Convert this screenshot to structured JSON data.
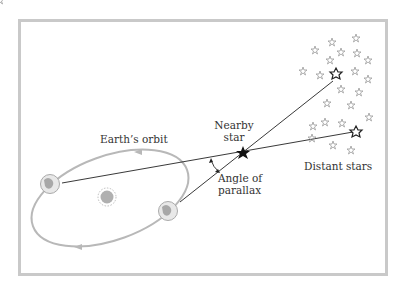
{
  "diagram": {
    "labels": {
      "orbit": "Earth’s orbit",
      "nearby_star_line1": "Nearby",
      "nearby_star_line2": "star",
      "angle_line1": "Angle of",
      "angle_line2": "parallax",
      "distant": "Distant stars"
    },
    "nodes": [
      "Earth (position 1)",
      "Earth (position 2)",
      "Sun",
      "Nearby star",
      "Distant star A",
      "Distant star B",
      "Background stars"
    ],
    "colors": {
      "frame": "#c9c9c9",
      "orbit": "#b8b8b8",
      "lines": "#222222",
      "background_stars": "#9a9a9a"
    }
  }
}
